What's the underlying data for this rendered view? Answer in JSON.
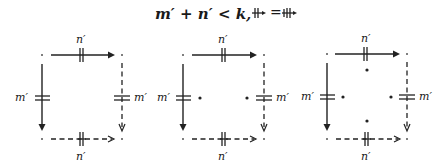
{
  "title": {
    "formula": "m′ + n′ < k,",
    "equation_lhs": "⧺",
    "equation_eq": "=",
    "equation_rhs": "⧻"
  },
  "labels": {
    "top": "n′",
    "bottom": "n′",
    "left": "m′",
    "right": "m′"
  },
  "diagrams": [
    {
      "name": "diagram-1",
      "corners": {
        "tl": [
          42,
          55
        ],
        "tr": [
          122,
          55
        ],
        "bl": [
          42,
          139
        ],
        "br": [
          122,
          139
        ]
      },
      "inner_dots": []
    },
    {
      "name": "diagram-2",
      "corners": {
        "tl": [
          183,
          55
        ],
        "tr": [
          264,
          55
        ],
        "bl": [
          183,
          139
        ],
        "br": [
          264,
          139
        ]
      },
      "inner_dots": [
        [
          200,
          98
        ],
        [
          247,
          98
        ]
      ]
    },
    {
      "name": "diagram-3",
      "corners": {
        "tl": [
          327,
          54
        ],
        "tr": [
          407,
          54
        ],
        "bl": [
          327,
          139
        ],
        "br": [
          407,
          139
        ]
      },
      "inner_dots": [
        [
          367,
          70
        ],
        [
          343,
          97
        ],
        [
          391,
          97
        ],
        [
          367,
          121
        ]
      ]
    }
  ],
  "colors": {
    "ink": "#222222",
    "background": "#ffffff"
  }
}
